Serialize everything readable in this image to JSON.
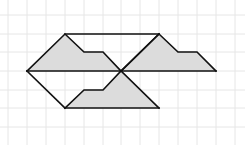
{
  "diagram": {
    "type": "geometric-tessellation-on-grid",
    "colors": {
      "background": "#ffffff",
      "grid": "#e6e6e6",
      "fill": "#dcdcdc",
      "stroke": "#111111"
    },
    "grid": {
      "x_lines": [
        8,
        27,
        46,
        65,
        84,
        103,
        121,
        140,
        159,
        178,
        197,
        216,
        235
      ],
      "y_lines": [
        15,
        34,
        52,
        71,
        90,
        108,
        127
      ]
    },
    "shaded_shapes": [
      {
        "name": "left-notched-trapezoid",
        "points": "27,71 65,34 84,52 103,52 121,71"
      },
      {
        "name": "right-notched-trapezoid",
        "points": "121,71 159,34 178,52 197,52 216,71"
      },
      {
        "name": "bottom-notched-trapezoid",
        "points": "65,108 84,90 103,90 121,71 159,108"
      }
    ],
    "outline_segments": [
      {
        "name": "top-edge",
        "points": "65,34 159,34"
      },
      {
        "name": "upper-right-diagonal",
        "points": "159,34 121,71"
      },
      {
        "name": "middle-horizontal",
        "points": "27,71 216,71"
      },
      {
        "name": "lower-left-diagonal",
        "points": "27,71 65,108"
      },
      {
        "name": "bottom-edge",
        "points": "65,108 159,108"
      },
      {
        "name": "left-shape-outline",
        "points": "27,71 65,34 84,52 103,52 121,71"
      },
      {
        "name": "right-shape-outline",
        "points": "121,71 159,34 178,52 197,52 216,71"
      },
      {
        "name": "bottom-shape-outline",
        "points": "65,108 84,90 103,90 121,71 159,108"
      }
    ]
  }
}
